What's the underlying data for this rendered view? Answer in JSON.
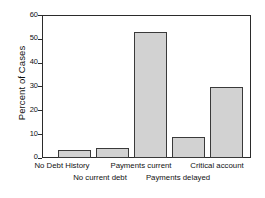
{
  "chart_data": {
    "type": "bar",
    "title": "",
    "xlabel": "",
    "ylabel": "Percent of Cases",
    "categories": [
      "No Debt History",
      "No current debt",
      "Payments current",
      "Payments delayed",
      "Critical account"
    ],
    "values": [
      3.4,
      4.3,
      52.8,
      8.9,
      29.8
    ],
    "ylim": [
      0,
      60
    ],
    "yticks": [
      0,
      10,
      20,
      30,
      40,
      50,
      60
    ],
    "ytick_labels": [
      "0",
      "10",
      "20",
      "30",
      "40",
      "50",
      "60"
    ],
    "grid": false,
    "legend": null,
    "bar_color": "#d2d2d2",
    "bar_edge_color": "#3a3a3a",
    "axis_color": "#2b2b2b",
    "label_layout": "staggered-two-rows"
  }
}
